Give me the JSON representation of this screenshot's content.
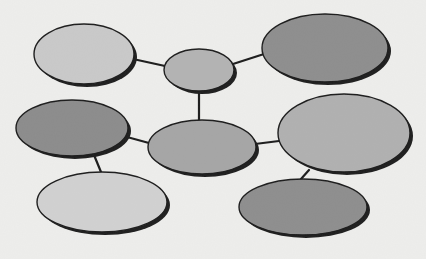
{
  "diagram": {
    "type": "bubble-map",
    "background": "#eeeeec",
    "outline_color": "#1a1a1a",
    "shadow_offset": [
      3,
      3
    ],
    "nodes": [
      {
        "id": "top-left",
        "cx": 84,
        "cy": 54,
        "rx": 50,
        "ry": 30,
        "fill": "#c9c9c9",
        "label": ""
      },
      {
        "id": "top-center",
        "cx": 199,
        "cy": 70,
        "rx": 35,
        "ry": 21,
        "fill": "#b3b3b3",
        "label": ""
      },
      {
        "id": "top-right",
        "cx": 325,
        "cy": 48,
        "rx": 63,
        "ry": 34,
        "fill": "#8d8d8d",
        "label": ""
      },
      {
        "id": "middle-left",
        "cx": 72,
        "cy": 128,
        "rx": 56,
        "ry": 28,
        "fill": "#8b8b8b",
        "label": ""
      },
      {
        "id": "center",
        "cx": 202,
        "cy": 147,
        "rx": 54,
        "ry": 27,
        "fill": "#a5a5a5",
        "label": ""
      },
      {
        "id": "middle-right",
        "cx": 344,
        "cy": 133,
        "rx": 66,
        "ry": 39,
        "fill": "#b0b0b0",
        "label": ""
      },
      {
        "id": "bottom-left",
        "cx": 102,
        "cy": 202,
        "rx": 65,
        "ry": 30,
        "fill": "#d1d1d1",
        "label": ""
      },
      {
        "id": "bottom-right",
        "cx": 303,
        "cy": 207,
        "rx": 64,
        "ry": 28,
        "fill": "#8d8d8d",
        "label": ""
      }
    ],
    "edges": [
      {
        "from": "top-left",
        "to": "top-center",
        "x1": 133,
        "y1": 59,
        "x2": 165,
        "y2": 66
      },
      {
        "from": "top-center",
        "to": "top-right",
        "x1": 233,
        "y1": 64,
        "x2": 264,
        "y2": 54
      },
      {
        "from": "top-center",
        "to": "center",
        "x1": 199,
        "y1": 91,
        "x2": 199,
        "y2": 120
      },
      {
        "from": "middle-left",
        "to": "center",
        "x1": 127,
        "y1": 137,
        "x2": 149,
        "y2": 143
      },
      {
        "from": "center",
        "to": "middle-right",
        "x1": 255,
        "y1": 144,
        "x2": 279,
        "y2": 141
      },
      {
        "from": "middle-left",
        "to": "bottom-left",
        "x1": 94,
        "y1": 155,
        "x2": 101,
        "y2": 172
      },
      {
        "from": "middle-right",
        "to": "bottom-right",
        "x1": 309,
        "y1": 170,
        "x2": 301,
        "y2": 179
      }
    ]
  }
}
